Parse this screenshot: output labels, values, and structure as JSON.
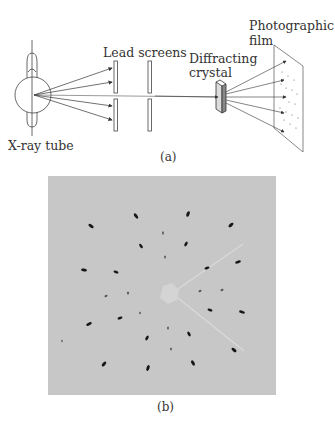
{
  "figure_a": {
    "caption": "(a)",
    "labels": {
      "xray_tube": "X-ray tube",
      "lead_screens": "Lead screens",
      "diffracting_crystal_line1": "Diffracting",
      "diffracting_crystal_line2": "crystal",
      "photographic_film_line1": "Photographic",
      "photographic_film_line2": "film"
    }
  },
  "figure_b": {
    "caption": "(b)",
    "description": "Laue diffraction pattern photograph"
  },
  "colors": {
    "line": "#333333",
    "photo_background": "#c7c7c7",
    "spot": "#1a1a1a"
  }
}
